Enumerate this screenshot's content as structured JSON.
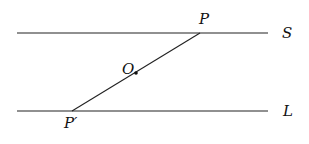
{
  "diagram": {
    "lines": [
      {
        "name": "S",
        "y": 33,
        "x1": 17,
        "x2": 268
      },
      {
        "name": "L",
        "y": 111,
        "x1": 17,
        "x2": 268
      }
    ],
    "segment": {
      "from": "P",
      "to": "P'",
      "through": "O"
    },
    "points": {
      "P": {
        "label": "P",
        "x": 200,
        "y": 33
      },
      "O": {
        "label": "O",
        "x": 136,
        "y": 72
      },
      "P_prime": {
        "label": "P′",
        "x": 72,
        "y": 111
      }
    },
    "labels": {
      "S": "S",
      "L": "L",
      "P": "P",
      "O": "O",
      "P_prime": "P′"
    },
    "colors": {
      "stroke": "#222222",
      "text": "#111111"
    }
  }
}
